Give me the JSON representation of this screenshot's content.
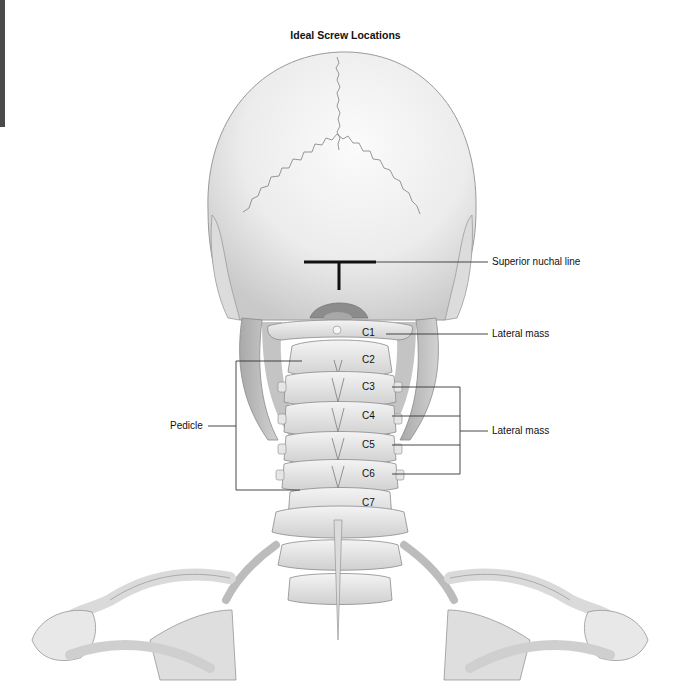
{
  "figure": {
    "title": "Ideal Screw Locations",
    "annotations": {
      "superior_nuchal_line": "Superior nuchal line",
      "lateral_mass_c1": "Lateral mass",
      "lateral_mass_c3_c6": "Lateral mass",
      "pedicle": "Pedicle"
    },
    "vertebrae": [
      "C1",
      "C2",
      "C3",
      "C4",
      "C5",
      "C6",
      "C7"
    ],
    "colors": {
      "bone": "#e9e9e9",
      "bone_shadow": "#b8b8b8",
      "outline": "#8a8a8a",
      "leader_line": "#333333",
      "marker": "#111111"
    }
  }
}
